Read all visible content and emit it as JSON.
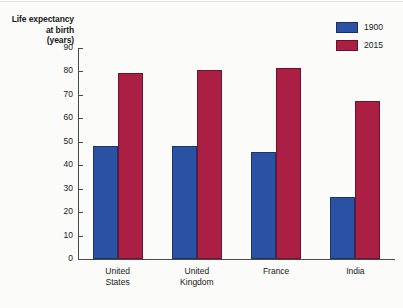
{
  "chart_data": {
    "type": "bar",
    "title": "",
    "xlabel": "",
    "ylabel": "Life expectancy at birth (years)",
    "ylabel_lines": [
      "Life expectancy",
      "at birth",
      "(years)"
    ],
    "categories": [
      "United States",
      "United Kingdom",
      "France",
      "India"
    ],
    "category_lines": [
      [
        "United",
        "States"
      ],
      [
        "United",
        "Kingdom"
      ],
      [
        "France"
      ],
      [
        "India"
      ]
    ],
    "series": [
      {
        "name": "1900",
        "color": "#2a51a3",
        "values": [
          48,
          48,
          45.5,
          26.5
        ]
      },
      {
        "name": "2015",
        "color": "#ab1f44",
        "values": [
          79.5,
          80.5,
          81.5,
          67.5
        ]
      }
    ],
    "ylim": [
      0,
      90
    ],
    "ytick_step": 10,
    "ytick_labels": [
      "90",
      "80",
      "70",
      "60",
      "50",
      "40",
      "30",
      "20",
      "10",
      "0"
    ],
    "ytick_values": [
      90,
      80,
      70,
      60,
      50,
      40,
      30,
      20,
      10,
      0
    ],
    "grid": false,
    "legend_position": "top-right"
  },
  "legend": {
    "entries": [
      {
        "label": "1900",
        "color": "#2a51a3"
      },
      {
        "label": "2015",
        "color": "#ab1f44"
      }
    ]
  }
}
